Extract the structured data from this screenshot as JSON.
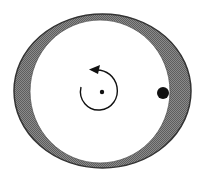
{
  "diagram": {
    "colors": {
      "background": "#ffffff",
      "ring_fill": "#7a7a7a",
      "ring_stroke": "#3a3a3a",
      "inner_fill": "#ffffff",
      "ink": "#111111"
    },
    "outer_ellipse": {
      "cx": 102.5,
      "cy": 91,
      "rx": 88.5,
      "ry": 77
    },
    "inner_circle": {
      "cx": 100,
      "cy": 91.5,
      "rx": 70,
      "ry": 71.5
    },
    "center_point": {
      "cx": 102,
      "cy": 92,
      "r": 2.2
    },
    "body": {
      "cx": 163,
      "cy": 93,
      "r": 6
    },
    "rotation_arrow": {
      "direction": "counter-clockwise"
    }
  }
}
